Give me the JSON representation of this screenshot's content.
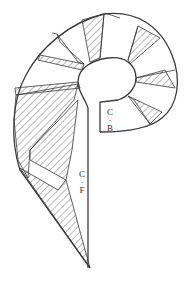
{
  "diagram": {
    "type": "pattern-piece",
    "colors": {
      "outline": "#3a3a3a",
      "hatch": "#555555",
      "background": "#ffffff"
    },
    "labels": {
      "center_back": {
        "top": "C",
        "dot": "·",
        "bottom": "B"
      },
      "center_front": {
        "top": "C",
        "dot": "·",
        "bottom": "F"
      }
    }
  }
}
